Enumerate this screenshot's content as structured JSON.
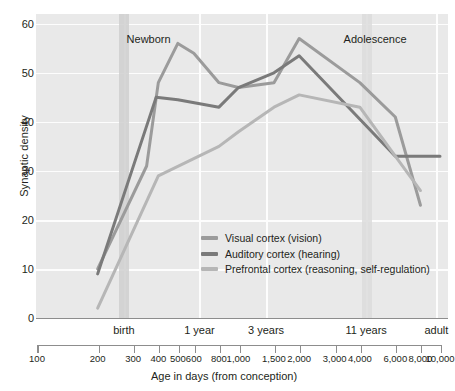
{
  "chart_data": {
    "type": "line",
    "title": "",
    "xlabel": "Age in days (from conception)",
    "ylabel": "Synaptic density",
    "xscale": "log",
    "xlim": [
      100,
      10000
    ],
    "ylim": [
      0,
      62
    ],
    "grid": true,
    "legend_position": "inside-center-left",
    "y_ticks": [
      0,
      10,
      20,
      30,
      40,
      50,
      60
    ],
    "x_ticks": [
      100,
      200,
      300,
      400,
      500,
      600,
      800,
      1000,
      1500,
      2000,
      3000,
      4000,
      6000,
      8000,
      10000
    ],
    "x_tick_labels": [
      "100",
      "200",
      "300",
      "400",
      "500",
      "600",
      "800",
      "1,000",
      "1,500",
      "2,000",
      "3,000",
      "4,000",
      "6,000",
      "8,000",
      "10,000"
    ],
    "x_category_labels": [
      {
        "label": "birth",
        "value": 270
      },
      {
        "label": "1 year",
        "value": 640
      },
      {
        "label": "3 years",
        "value": 1370
      },
      {
        "label": "11 years",
        "value": 4300
      },
      {
        "label": "adult",
        "value": 9600
      }
    ],
    "annotations": [
      {
        "label": "Newborn",
        "value": 260
      },
      {
        "label": "Adolescence",
        "value": 4900
      }
    ],
    "bands": [
      {
        "label": "birth-band",
        "from": 255,
        "to": 285,
        "color": "#cfcfcf"
      },
      {
        "label": "adolescence-band",
        "from": 4100,
        "to": 4600,
        "color": "#dcdcdc"
      }
    ],
    "series": [
      {
        "name": "Visual cortex (vision)",
        "color": "#9b9b9b",
        "points": [
          [
            200,
            10
          ],
          [
            350,
            31
          ],
          [
            400,
            48
          ],
          [
            500,
            56
          ],
          [
            600,
            54
          ],
          [
            800,
            48
          ],
          [
            1000,
            47
          ],
          [
            1500,
            48
          ],
          [
            2000,
            57
          ],
          [
            4000,
            48
          ],
          [
            6000,
            41
          ],
          [
            8000,
            23
          ]
        ]
      },
      {
        "name": "Auditory cortex (hearing)",
        "color": "#7a7a7a",
        "points": [
          [
            200,
            9
          ],
          [
            390,
            45
          ],
          [
            500,
            44.5
          ],
          [
            800,
            43
          ],
          [
            1000,
            47
          ],
          [
            1500,
            50
          ],
          [
            2000,
            53.5
          ],
          [
            6000,
            33
          ],
          [
            10000,
            33
          ]
        ]
      },
      {
        "name": "Prefrontal cortex (reasoning, self-regulation)",
        "color": "#b6b6b6",
        "points": [
          [
            200,
            2
          ],
          [
            400,
            29
          ],
          [
            800,
            35
          ],
          [
            1000,
            38
          ],
          [
            1500,
            43
          ],
          [
            2000,
            45.5
          ],
          [
            4000,
            43
          ],
          [
            6000,
            33
          ],
          [
            8000,
            26
          ]
        ]
      }
    ]
  },
  "axes": {
    "y_title": "Synaptic density",
    "x_title": "Age in days (from conception)"
  },
  "legend": {
    "entries": [
      {
        "label": "Visual cortex (vision)",
        "color": "#9b9b9b"
      },
      {
        "label": "Auditory cortex (hearing)",
        "color": "#7a7a7a"
      },
      {
        "label": "Prefrontal cortex (reasoning, self-regulation)",
        "color": "#b6b6b6"
      }
    ]
  },
  "colors": {
    "plot_background": "#e9e9e9",
    "gridline": "#fdfdfd",
    "axis": "#8d8d8d",
    "text": "#231f20"
  }
}
